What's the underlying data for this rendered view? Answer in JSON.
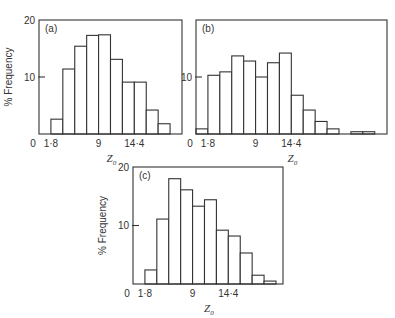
{
  "chart_data": [
    {
      "id": "a",
      "type": "bar",
      "panel_label": "(a)",
      "title": "",
      "xlabel": "Z0",
      "ylabel": "% Frequency",
      "ylim": [
        0,
        20
      ],
      "y_ticks": [
        "20",
        "10"
      ],
      "x_ticks": [
        "0",
        "1.8",
        "9",
        "14.4"
      ],
      "bin_width": 1.8,
      "bins_start": [
        1.8,
        3.6,
        5.4,
        7.2,
        9.0,
        10.8,
        12.6,
        14.4,
        16.2,
        18.0
      ],
      "values": [
        2.6,
        11.4,
        15.4,
        17.3,
        17.4,
        13.1,
        9.1,
        9.1,
        4.2,
        1.8
      ],
      "grid": false
    },
    {
      "id": "b",
      "type": "bar",
      "panel_label": "(b)",
      "title": "",
      "xlabel": "Z0",
      "ylabel": "",
      "ylim": [
        0,
        20
      ],
      "y_ticks": [
        "10"
      ],
      "x_ticks": [
        "0",
        "1.8",
        "9",
        "14.4"
      ],
      "bin_width": 1.8,
      "bins_start": [
        0,
        1.8,
        3.6,
        5.4,
        7.2,
        9.0,
        10.8,
        12.6,
        14.4,
        16.2,
        18.0,
        19.8,
        21.6,
        23.4,
        25.2
      ],
      "values": [
        0.9,
        10.3,
        10.9,
        13.7,
        12.8,
        10.0,
        12.5,
        14.2,
        6.8,
        4.2,
        2.2,
        0.9,
        0,
        0.4,
        0.4
      ],
      "grid": false
    },
    {
      "id": "c",
      "type": "bar",
      "panel_label": "(c)",
      "title": "",
      "xlabel": "Z0",
      "ylabel": "% Frequency",
      "ylim": [
        0,
        20
      ],
      "y_ticks": [
        "20",
        "10"
      ],
      "x_ticks": [
        "0",
        "1.8",
        "9",
        "14.4"
      ],
      "bin_width": 1.8,
      "bins_start": [
        1.8,
        3.6,
        5.4,
        7.2,
        9.0,
        10.8,
        12.6,
        14.4,
        16.2,
        18.0,
        19.8
      ],
      "values": [
        2.4,
        11.1,
        18.0,
        16.1,
        13.3,
        14.4,
        9.2,
        8.2,
        5.3,
        1.5,
        0.5
      ],
      "grid": false
    }
  ],
  "labels": {
    "xlabel_main": "Z",
    "xlabel_sub": "0",
    "ylabel": "% Frequency"
  }
}
